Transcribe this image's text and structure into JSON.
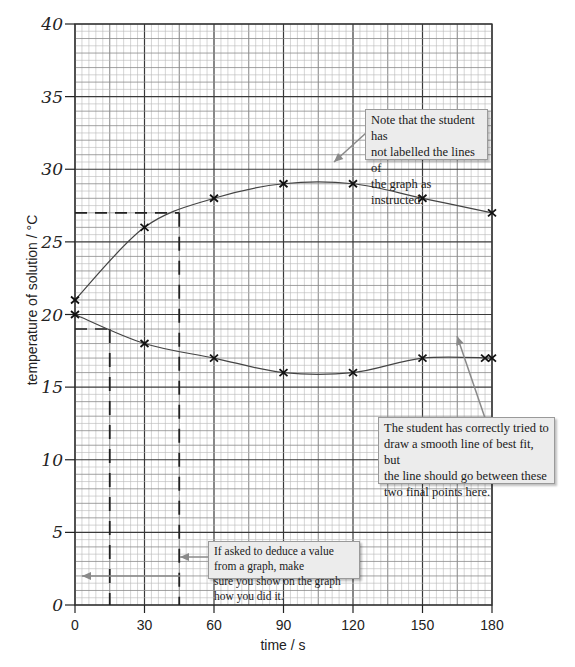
{
  "chart_data": {
    "type": "line",
    "title": "",
    "xlabel": "time / s",
    "ylabel": "temperature of solution / °C",
    "xlim": [
      0,
      180
    ],
    "ylim": [
      0,
      40
    ],
    "x_ticks": [
      "0",
      "30",
      "60",
      "90",
      "120",
      "150",
      "180"
    ],
    "y_ticks": [
      "0",
      "5",
      "10",
      "15",
      "20",
      "25",
      "30",
      "35",
      "40"
    ],
    "grid": true,
    "legend": null,
    "x": [
      0,
      30,
      60,
      90,
      120,
      150,
      180
    ],
    "series": [
      {
        "name": "upper line (unlabelled)",
        "values": [
          21,
          26,
          28,
          29,
          29,
          28,
          27
        ]
      },
      {
        "name": "lower line (unlabelled)",
        "values": [
          20,
          18,
          17,
          16,
          16,
          17,
          17
        ],
        "extra_points": [
          [
            177,
            17
          ]
        ]
      }
    ],
    "reading_lines": [
      {
        "x": 45,
        "y": 27,
        "description": "dashed read-off on upper line"
      },
      {
        "x": 15,
        "y": 19,
        "description": "dashed read-off on lower line"
      }
    ],
    "annotations": [
      "Note that the student has not labelled the lines of the graph as instructed.",
      "The student has correctly tried to draw a smooth line of best fit, but the line should go between these two final points here.",
      "If asked to deduce a value from a graph, make sure you show on the graph how you did it."
    ]
  },
  "axes": {
    "xlabel": "time / s",
    "ylabel": "temperature of solution / °C"
  },
  "notes": {
    "labels": {
      "line1": "Note that the student has",
      "line2": "not labelled the lines of",
      "line3": "the graph as instructed."
    },
    "smooth": {
      "line1": "The student has correctly tried to",
      "line2": "draw a smooth line of best fit, but",
      "line3": "the line should go between these",
      "line4": "two final points here."
    },
    "deduce": {
      "line1": "If asked to deduce a value from a graph, make",
      "line2": "sure you show on the graph how you did it."
    }
  },
  "colors": {
    "grid_minor": "#b8b8b8",
    "grid_major": "#3a3a3a",
    "curve": "#444444",
    "note_bg": "#ececec",
    "arrow": "#8a8a8a"
  }
}
